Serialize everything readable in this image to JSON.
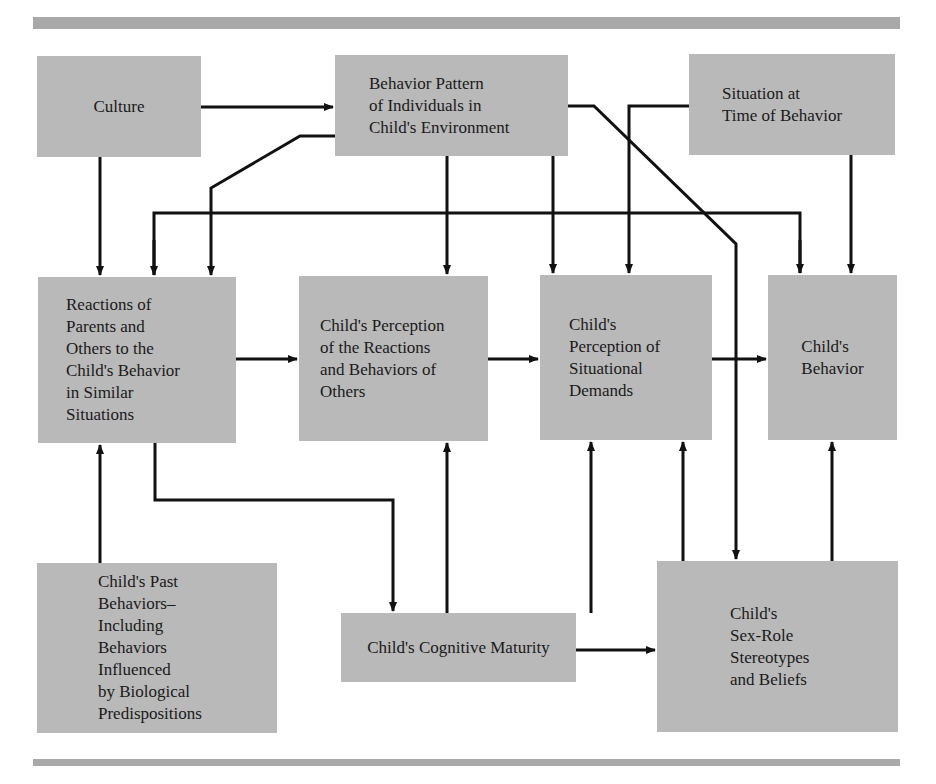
{
  "colors": {
    "box_fill": "#b9b9b9",
    "rule_bar": "#a9a9a9",
    "line": "#111111",
    "background": "#ffffff"
  },
  "nodes": {
    "culture": {
      "label": "Culture"
    },
    "behavior_pattern": {
      "label": "Behavior Pattern\nof Individuals in\nChild's Environment"
    },
    "situation": {
      "label": "Situation at\nTime of Behavior"
    },
    "reactions": {
      "label": "Reactions of\nParents and\nOthers to the\nChild's Behavior\nin Similar\nSituations"
    },
    "perception_reactions": {
      "label": "Child's Perception\nof the Reactions\nand Behaviors of\nOthers"
    },
    "perception_situational": {
      "label": "Child's\nPerception of\nSituational\nDemands"
    },
    "child_behavior": {
      "label": "Child's\nBehavior"
    },
    "past_behaviors": {
      "label": "Child's Past\nBehaviors–\nIncluding\nBehaviors\nInfluenced\nby Biological\nPredispositions"
    },
    "cognitive_maturity": {
      "label": "Child's Cognitive Maturity"
    },
    "sex_role": {
      "label": "Child's\nSex-Role\nStereotypes\nand Beliefs"
    }
  },
  "edges": [
    {
      "from": "Culture",
      "to": "Behavior Pattern of Individuals in Child's Environment"
    },
    {
      "from": "Culture",
      "to": "Reactions of Parents and Others"
    },
    {
      "from": "Behavior Pattern of Individuals in Child's Environment",
      "to": "Reactions of Parents and Others"
    },
    {
      "from": "Behavior Pattern of Individuals in Child's Environment",
      "to": "Child's Perception of the Reactions and Behaviors of Others"
    },
    {
      "from": "Behavior Pattern of Individuals in Child's Environment",
      "to": "Child's Perception of Situational Demands"
    },
    {
      "from": "Behavior Pattern of Individuals in Child's Environment",
      "to": "Child's Sex-Role Stereotypes and Beliefs"
    },
    {
      "from": "Situation at Time of Behavior",
      "to": "Child's Perception of Situational Demands"
    },
    {
      "from": "Situation at Time of Behavior",
      "to": "Child's Behavior"
    },
    {
      "from": "Child's Behavior (feedback line)",
      "to": "Reactions of Parents and Others"
    },
    {
      "from": "Child's Behavior (feedback line)",
      "to": "Child's Behavior"
    },
    {
      "from": "Reactions of Parents and Others",
      "to": "Child's Perception of the Reactions and Behaviors of Others"
    },
    {
      "from": "Child's Perception of the Reactions and Behaviors of Others",
      "to": "Child's Perception of Situational Demands"
    },
    {
      "from": "Child's Perception of Situational Demands",
      "to": "Child's Behavior"
    },
    {
      "from": "Child's Past Behaviors",
      "to": "Reactions of Parents and Others"
    },
    {
      "from": "Reactions of Parents and Others",
      "to": "Child's Cognitive Maturity"
    },
    {
      "from": "Child's Cognitive Maturity",
      "to": "Child's Perception of the Reactions and Behaviors of Others"
    },
    {
      "from": "Child's Cognitive Maturity",
      "to": "Child's Perception of Situational Demands"
    },
    {
      "from": "Child's Cognitive Maturity",
      "to": "Child's Sex-Role Stereotypes and Beliefs"
    },
    {
      "from": "Child's Sex-Role Stereotypes and Beliefs",
      "to": "Child's Perception of Situational Demands"
    },
    {
      "from": "Child's Sex-Role Stereotypes and Beliefs",
      "to": "Child's Behavior"
    }
  ]
}
